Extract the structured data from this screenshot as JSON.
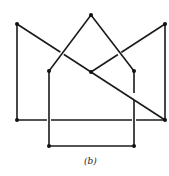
{
  "figure": {
    "caption": "(b)",
    "colors": {
      "stroke": "#1a1a1a",
      "node": "#111111",
      "background": "#ffffff"
    },
    "nodes": [
      {
        "id": "apex",
        "x": 91,
        "y": 15
      },
      {
        "id": "outer-top-left",
        "x": 17,
        "y": 24
      },
      {
        "id": "outer-top-right",
        "x": 165,
        "y": 24
      },
      {
        "id": "inner-left",
        "x": 49,
        "y": 71
      },
      {
        "id": "center",
        "x": 91,
        "y": 72
      },
      {
        "id": "inner-right",
        "x": 134,
        "y": 71
      },
      {
        "id": "outer-bottom-left",
        "x": 17,
        "y": 120
      },
      {
        "id": "outer-bottom-right",
        "x": 165,
        "y": 120
      },
      {
        "id": "bottom-left",
        "x": 49,
        "y": 146
      },
      {
        "id": "bottom-right",
        "x": 134,
        "y": 146
      }
    ],
    "edges": [
      [
        "outer-top-left",
        "outer-bottom-left"
      ],
      [
        "outer-top-left",
        "outer-bottom-right"
      ],
      [
        "outer-bottom-left",
        "outer-bottom-right"
      ],
      [
        "outer-top-right",
        "outer-bottom-right"
      ],
      [
        "outer-top-right",
        "center"
      ],
      [
        "apex",
        "inner-left"
      ],
      [
        "apex",
        "inner-right"
      ],
      [
        "inner-left",
        "bottom-left"
      ],
      [
        "inner-right",
        "bottom-right"
      ],
      [
        "bottom-left",
        "bottom-right"
      ]
    ]
  }
}
